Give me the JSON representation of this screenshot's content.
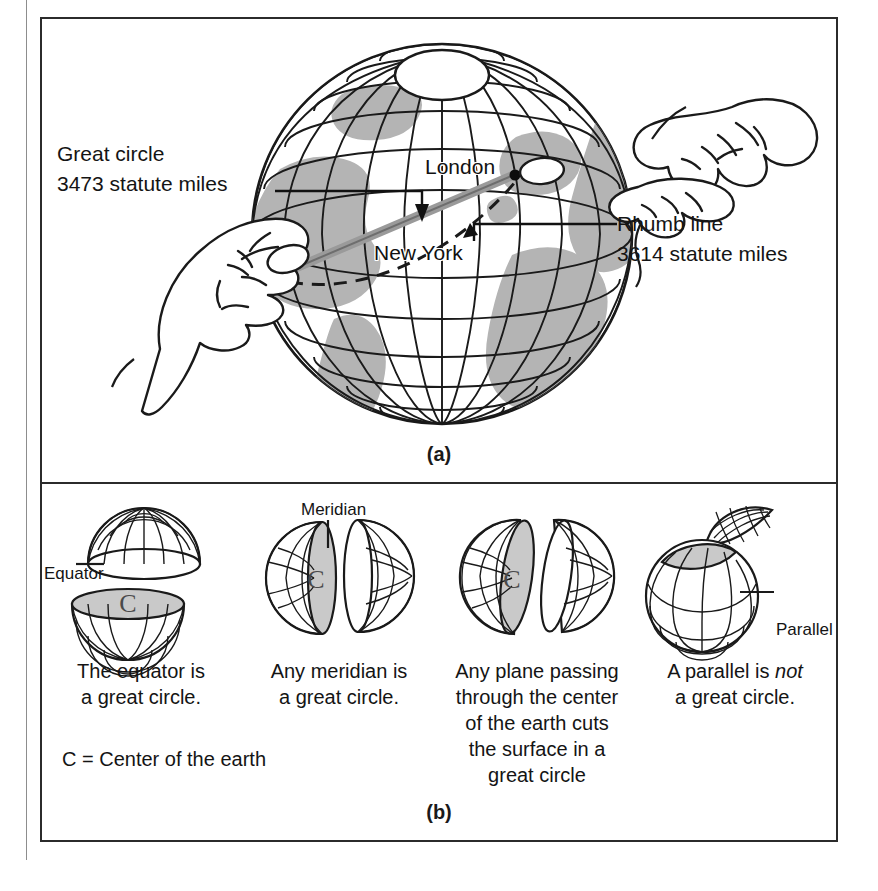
{
  "figure": {
    "panel_a": {
      "caption": "(a)",
      "annotations": [
        {
          "name": "great-circle",
          "line1": "Great  circle",
          "line2": "3473 statute miles"
        },
        {
          "name": "rhumb-line",
          "line1": "Rhumb line",
          "line2": "3614 statute miles"
        }
      ],
      "place_labels": [
        {
          "name": "london",
          "text": "London"
        },
        {
          "name": "new-york",
          "text": "New York"
        }
      ]
    },
    "panel_b": {
      "caption": "(b)",
      "note": "C  =  Center of the earth",
      "cells": [
        {
          "art": "globe-split-equator",
          "side_label": "Equator",
          "center_letter": "C",
          "caption_line1": "The equator is",
          "caption_line2": "a great circle.",
          "caption_italic": ""
        },
        {
          "art": "globe-split-meridian",
          "side_label": "Meridian",
          "center_letter": "C",
          "caption_line1": "Any meridian is",
          "caption_line2": "a great circle.",
          "caption_italic": ""
        },
        {
          "art": "globe-split-oblique",
          "side_label": "",
          "center_letter": "C",
          "caption_line1": "Any plane passing",
          "caption_line2": "through the center",
          "caption_line3": "of the earth cuts",
          "caption_line4": "the surface in a",
          "caption_line5": "great circle",
          "caption_italic": ""
        },
        {
          "art": "globe-split-parallel",
          "side_label": "Parallel",
          "center_letter": "",
          "caption_line1": "A parallel is ",
          "caption_italic": "not",
          "caption_line2": "a great circle."
        }
      ]
    }
  },
  "colors": {
    "ink": "#1a1a1a",
    "frame": "#2b2b2b",
    "land_fill": "#b4b4b4",
    "cut_fill": "#c9c9c9",
    "paper": "#ffffff"
  }
}
